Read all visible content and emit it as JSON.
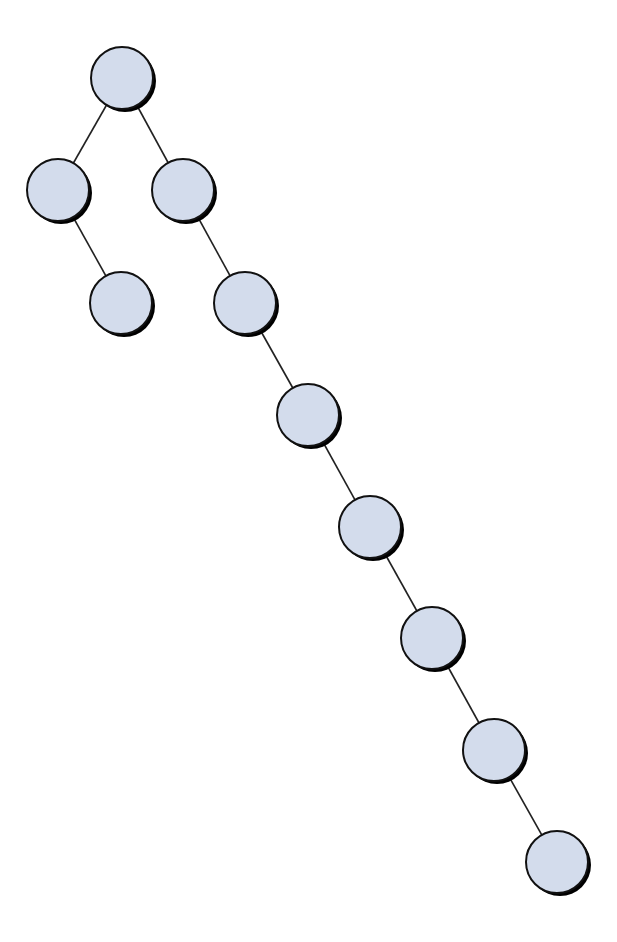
{
  "diagram": {
    "type": "binary-tree",
    "node_fill": "#d3dcec",
    "node_stroke": "#111111",
    "edge_color": "#222222",
    "node_radius": 31,
    "nodes": [
      {
        "id": "n0",
        "x": 122,
        "y": 78
      },
      {
        "id": "n1",
        "x": 58,
        "y": 190
      },
      {
        "id": "n2",
        "x": 183,
        "y": 190
      },
      {
        "id": "n3",
        "x": 121,
        "y": 303
      },
      {
        "id": "n4",
        "x": 245,
        "y": 303
      },
      {
        "id": "n5",
        "x": 308,
        "y": 415
      },
      {
        "id": "n6",
        "x": 370,
        "y": 527
      },
      {
        "id": "n7",
        "x": 432,
        "y": 638
      },
      {
        "id": "n8",
        "x": 494,
        "y": 750
      },
      {
        "id": "n9",
        "x": 557,
        "y": 862
      }
    ],
    "edges": [
      [
        "n0",
        "n1"
      ],
      [
        "n0",
        "n2"
      ],
      [
        "n1",
        "n3"
      ],
      [
        "n2",
        "n4"
      ],
      [
        "n4",
        "n5"
      ],
      [
        "n5",
        "n6"
      ],
      [
        "n6",
        "n7"
      ],
      [
        "n7",
        "n8"
      ],
      [
        "n8",
        "n9"
      ]
    ]
  }
}
